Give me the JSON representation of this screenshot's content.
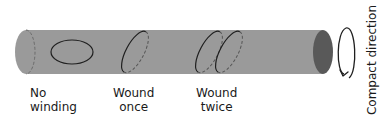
{
  "diagram": {
    "colors": {
      "cylinder_body": "#9a9a9a",
      "cylinder_end_cap": "#595959",
      "loop_stroke": "#1f1f1f",
      "text": "#1a1a1a",
      "background": "#ffffff"
    },
    "loops": [
      {
        "id": "no-winding",
        "label_line1": "No",
        "label_line2": "winding",
        "winds": 0
      },
      {
        "id": "wound-once",
        "label_line1": "Wound",
        "label_line2": "once",
        "winds": 1
      },
      {
        "id": "wound-twice",
        "label_line1": "Wound",
        "label_line2": "twice",
        "winds": 2
      }
    ],
    "compact_direction": {
      "label": "Compact direction",
      "icon": "circular-arrow-icon"
    }
  }
}
